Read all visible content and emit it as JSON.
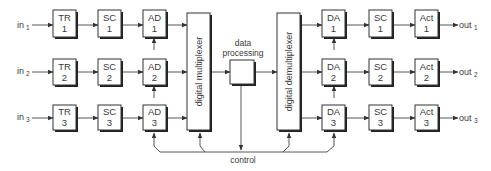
{
  "diagram": {
    "type": "block-diagram",
    "inputs": [
      {
        "label": "in",
        "sub": "1"
      },
      {
        "label": "in",
        "sub": "2"
      },
      {
        "label": "in",
        "sub": "3"
      }
    ],
    "outputs": [
      {
        "label": "out",
        "sub": "1"
      },
      {
        "label": "out",
        "sub": "2"
      },
      {
        "label": "out",
        "sub": "3"
      }
    ],
    "input_chain": [
      {
        "name": "TR",
        "rows": [
          "1",
          "2",
          "3"
        ]
      },
      {
        "name": "SC",
        "rows": [
          "1",
          "2",
          "3"
        ]
      },
      {
        "name": "AD",
        "rows": [
          "1",
          "2",
          "3"
        ]
      }
    ],
    "output_chain": [
      {
        "name": "DA",
        "rows": [
          "1",
          "2",
          "3"
        ]
      },
      {
        "name": "SC",
        "rows": [
          "1",
          "2",
          "3"
        ]
      },
      {
        "name": "Act",
        "rows": [
          "1",
          "2",
          "3"
        ]
      }
    ],
    "multiplexer_label": "digital multiplexer",
    "demultiplexer_label": "digital demultiplexer",
    "processing_label_line1": "data",
    "processing_label_line2": "processing",
    "control_label": "control"
  }
}
